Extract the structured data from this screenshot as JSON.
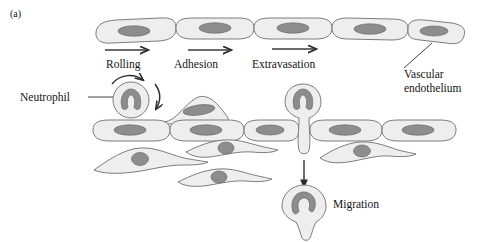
{
  "figure": {
    "panel_label": "(a)",
    "caption_topic": "neutrophil-extravasation-diagram"
  },
  "labels": {
    "rolling": "Rolling",
    "adhesion": "Adhesion",
    "extravasation": "Extravasation",
    "neutrophil": "Neutrophil",
    "vascular_line1": "Vascular",
    "vascular_line2": "endothelium",
    "migration": "Migration"
  },
  "colors": {
    "cell_fill": "#eeeeee",
    "cell_stroke": "#6e6e6e",
    "nucleus_fill": "#8d8d8d",
    "nucleus_stroke": "#6a6a6a",
    "arrow": "#2b2b2b",
    "text": "#141414",
    "background": "#ffffff"
  },
  "diagram_elements": {
    "top_endothelium_cell_count": 5,
    "bottom_endothelium_cell_count": 5,
    "tissue_cell_count": 4,
    "neutrophil_states": [
      "rolling",
      "adhering-spread",
      "extravasating",
      "migrating"
    ],
    "straight_arrow_count": 4,
    "curved_arrow_count": 2
  }
}
